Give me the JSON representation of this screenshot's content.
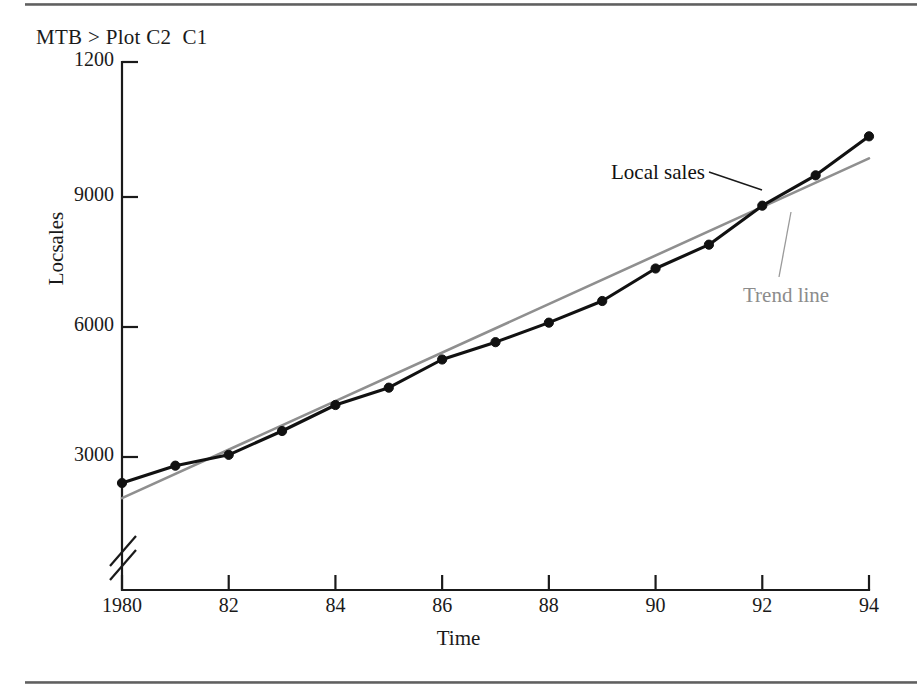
{
  "document": {
    "rule_top": "horizontal-rule",
    "rule_bottom": "horizontal-rule"
  },
  "terminal": {
    "command_line": "MTB > Plot C2  C1"
  },
  "annotations": {
    "local_sales_label": "Local sales",
    "trend_line_label": "Trend line"
  },
  "colors": {
    "series": "#111111",
    "trend": "#8f8f8f",
    "axis": "#1a1a1a",
    "rule": "#5a5a5a",
    "background": "#ffffff"
  },
  "chart_data": {
    "type": "line",
    "title": "",
    "subtitle": "",
    "xlabel": "Time",
    "ylabel": "Locsales",
    "grid": false,
    "legend_position": "inline-annotations",
    "axis_break": true,
    "axis_break_note": "y-axis broken below 3000 (zero suppressed)",
    "xlim": [
      1980,
      1994
    ],
    "ylim": [
      2000,
      12000
    ],
    "x_tick_labels": [
      "1980",
      "82",
      "84",
      "86",
      "88",
      "90",
      "92",
      "94"
    ],
    "x_ticks": [
      1980,
      1982,
      1984,
      1986,
      1988,
      1990,
      1992,
      1994
    ],
    "y_tick_labels": [
      "1200",
      "9000",
      "6000",
      "3000"
    ],
    "y_ticks": [
      12000,
      9000,
      6000,
      3000
    ],
    "x": [
      1980,
      1981,
      1982,
      1983,
      1984,
      1985,
      1986,
      1987,
      1988,
      1989,
      1990,
      1991,
      1992,
      1993,
      1994
    ],
    "series": [
      {
        "name": "Local sales",
        "color": "#111111",
        "markers": true,
        "values": [
          2400,
          2800,
          3050,
          3600,
          4200,
          4600,
          5250,
          5650,
          6100,
          6600,
          7350,
          7900,
          8800,
          9500,
          10400
        ]
      },
      {
        "name": "Trend line",
        "color": "#8f8f8f",
        "markers": false,
        "values": [
          2050,
          2610,
          3170,
          3730,
          4290,
          4850,
          5410,
          5970,
          6530,
          7090,
          7650,
          8210,
          8770,
          9330,
          9890
        ]
      }
    ]
  }
}
